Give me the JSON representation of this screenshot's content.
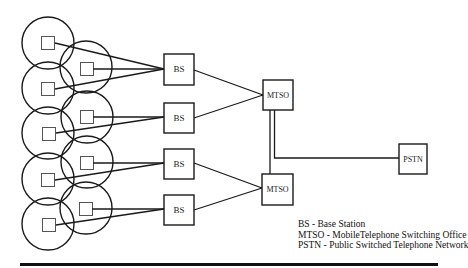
{
  "diagram": {
    "type": "cellular-network-architecture",
    "cells": {
      "left_column": [
        {
          "cx": 48,
          "cy": 43,
          "r": 26
        },
        {
          "cx": 48,
          "cy": 88,
          "r": 26
        },
        {
          "cx": 48,
          "cy": 133,
          "r": 26
        },
        {
          "cx": 48,
          "cy": 179,
          "r": 26
        },
        {
          "cx": 48,
          "cy": 224,
          "r": 26
        }
      ],
      "right_column": [
        {
          "cx": 86,
          "cy": 67,
          "r": 26
        },
        {
          "cx": 87,
          "cy": 117,
          "r": 26
        },
        {
          "cx": 87,
          "cy": 162,
          "r": 26
        },
        {
          "cx": 86,
          "cy": 208,
          "r": 26
        }
      ]
    },
    "nodes": {
      "bs1": {
        "label": "BS",
        "x": 164,
        "y": 54,
        "w": 30,
        "h": 31
      },
      "bs2": {
        "label": "BS",
        "x": 164,
        "y": 103,
        "w": 30,
        "h": 30
      },
      "bs3": {
        "label": "BS",
        "x": 164,
        "y": 149,
        "w": 30,
        "h": 30
      },
      "bs4": {
        "label": "BS",
        "x": 164,
        "y": 195,
        "w": 30,
        "h": 30
      },
      "mtso1": {
        "label": "MTSO",
        "x": 263,
        "y": 80,
        "w": 30,
        "h": 30
      },
      "mtso2": {
        "label": "MTSO",
        "x": 262,
        "y": 174,
        "w": 31,
        "h": 31
      },
      "pstn": {
        "label": "PSTN",
        "x": 399,
        "y": 144,
        "w": 28,
        "h": 30
      }
    },
    "connections": [
      {
        "from": "cell-l1",
        "to": "bs1"
      },
      {
        "from": "cell-r1",
        "to": "bs1"
      },
      {
        "from": "cell-l2",
        "to": "bs1"
      },
      {
        "from": "cell-r2",
        "to": "bs2"
      },
      {
        "from": "cell-l3",
        "to": "bs2"
      },
      {
        "from": "cell-r3",
        "to": "bs3"
      },
      {
        "from": "cell-l4",
        "to": "bs3"
      },
      {
        "from": "cell-r4",
        "to": "bs4"
      },
      {
        "from": "cell-l5",
        "to": "bs4"
      },
      {
        "from": "bs1",
        "to": "mtso1"
      },
      {
        "from": "bs2",
        "to": "mtso1"
      },
      {
        "from": "bs3",
        "to": "mtso2"
      },
      {
        "from": "bs4",
        "to": "mtso2"
      },
      {
        "from": "mtso1",
        "to": "mtso2"
      },
      {
        "from": "mtso1",
        "to": "pstn"
      }
    ]
  },
  "legend": {
    "items": [
      "BS - Base Station",
      "MTSO - MobileTelephone Switching Office",
      "PSTN - Public Switched Telephone Network"
    ]
  },
  "colors": {
    "stroke": "#1a1a1a",
    "cell_square": "#555555",
    "background": "#ffffff"
  }
}
